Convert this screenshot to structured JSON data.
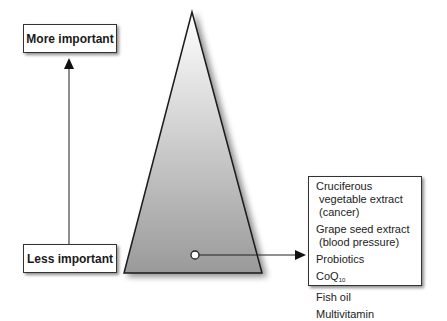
{
  "diagram": {
    "labels": {
      "top": "More important",
      "bottom": "Less important"
    },
    "list_items": [
      {
        "line1": "Cruciferous",
        "line2": "vegetable extract",
        "line3": "(cancer)"
      },
      {
        "line1": "Grape seed extract",
        "line2": "(blood pressure)"
      },
      {
        "line1": "Probiotics"
      },
      {
        "line1": "CoQ",
        "sub": "10"
      },
      {
        "line1": "Fish oil"
      },
      {
        "line1": "Multivitamin"
      }
    ],
    "colors": {
      "triangle_top": "#ffffff",
      "triangle_bottom": "#9a9a9a",
      "stroke": "#1a1a1a"
    }
  }
}
